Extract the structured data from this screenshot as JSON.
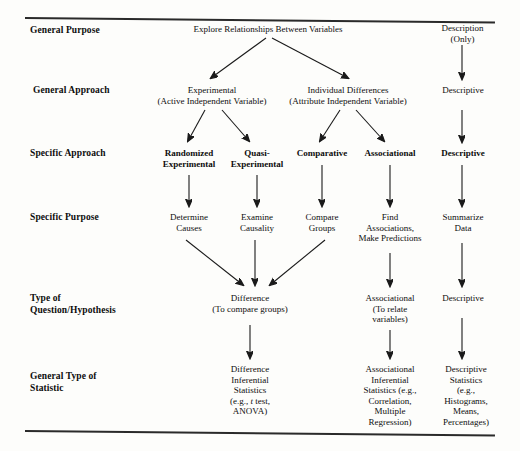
{
  "figure": {
    "title_rule_color": "#2a2a2a",
    "text_color": "#0d0d0d",
    "background": "#fdfdfb"
  },
  "rows": [
    {
      "id": "general-purpose",
      "label": "General Purpose"
    },
    {
      "id": "general-approach",
      "label": "General Approach"
    },
    {
      "id": "specific-approach",
      "label": "Specific Approach"
    },
    {
      "id": "specific-purpose",
      "label": "Specific Purpose"
    },
    {
      "id": "type-of-question",
      "label": "Type of\nQuestion/Hypothesis"
    },
    {
      "id": "general-type-statistic",
      "label": "General Type of\nStatistic"
    }
  ],
  "nodes": {
    "explore_relationships": "Explore Relationships Between Variables",
    "description_only": "Description\n(Only)",
    "experimental": "Experimental\n(Active Independent Variable)",
    "individual_differences": "Individual Differences\n(Attribute Independent Variable)",
    "descriptive_approach": "Descriptive",
    "randomized_experimental": "Randomized\nExperimental",
    "quasi_experimental": "Quasi-\nExperimental",
    "comparative": "Comparative",
    "associational": "Associational",
    "descriptive_specific": "Descriptive",
    "determine_causes": "Determine\nCauses",
    "examine_causality": "Examine\nCausality",
    "compare_groups": "Compare\nGroups",
    "find_associations": "Find\nAssociations,\nMake Predictions",
    "summarize_data": "Summarize\nData",
    "difference_question": "Difference\n(To compare groups)",
    "associational_question": "Associational\n(To relate\nvariables)",
    "descriptive_question": "Descriptive",
    "difference_statistic_a": "Difference\nInferential\nStatistics",
    "difference_statistic_b": "(e.g., ",
    "difference_statistic_t": "t",
    "difference_statistic_c": " test,\nANOVA)",
    "associational_statistic": "Associational\nInferential\nStatistics (e.g.,\nCorrelation,\nMultiple\nRegression)",
    "descriptive_statistic": "Descriptive\nStatistics\n(e.g.,\nHistograms,\nMeans,\nPercentages)"
  }
}
